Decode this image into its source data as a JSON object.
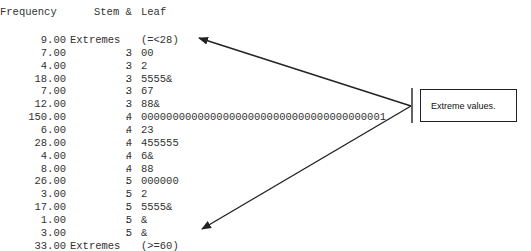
{
  "header": {
    "frequency": "Frequency",
    "stem": "Stem &",
    "leaf": "Leaf"
  },
  "rows": [
    {
      "freq": "9.00",
      "stem": "Extremes",
      "dot": "",
      "leaf": "(=<28)",
      "extreme": true
    },
    {
      "freq": "7.00",
      "stem": "3",
      "dot": ".",
      "leaf": "00"
    },
    {
      "freq": "4.00",
      "stem": "3",
      "dot": ".",
      "leaf": "2"
    },
    {
      "freq": "18.00",
      "stem": "3",
      "dot": ".",
      "leaf": "5555&"
    },
    {
      "freq": "7.00",
      "stem": "3",
      "dot": ".",
      "leaf": "67"
    },
    {
      "freq": "12.00",
      "stem": "3",
      "dot": ".",
      "leaf": "88&"
    },
    {
      "freq": "150.00",
      "stem": "4",
      "dot": ".",
      "leaf": "000000000000000000000000000000000000001"
    },
    {
      "freq": "6.00",
      "stem": "4",
      "dot": ".",
      "leaf": "23"
    },
    {
      "freq": "28.00",
      "stem": "4",
      "dot": ".",
      "leaf": "455555"
    },
    {
      "freq": "4.00",
      "stem": "4",
      "dot": ".",
      "leaf": "6&"
    },
    {
      "freq": "8.00",
      "stem": "4",
      "dot": ".",
      "leaf": "88"
    },
    {
      "freq": "26.00",
      "stem": "5",
      "dot": ".",
      "leaf": "000000"
    },
    {
      "freq": "3.00",
      "stem": "5",
      "dot": ".",
      "leaf": "2"
    },
    {
      "freq": "17.00",
      "stem": "5",
      "dot": ".",
      "leaf": "5555&"
    },
    {
      "freq": "1.00",
      "stem": "5",
      "dot": ".",
      "leaf": "&"
    },
    {
      "freq": "3.00",
      "stem": "5",
      "dot": ".",
      "leaf": "&"
    },
    {
      "freq": "33.00",
      "stem": "Extremes",
      "dot": "",
      "leaf": "(>=60)",
      "extreme": true
    }
  ],
  "annotation": {
    "label": "Extreme values."
  },
  "colors": {
    "text": "#333333",
    "arrow": "#222222"
  }
}
